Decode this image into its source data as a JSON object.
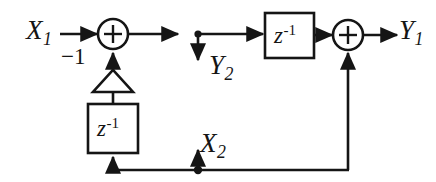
{
  "diagram": {
    "kind": "signal-flow-block-diagram",
    "title": "",
    "stroke_color": "#151515",
    "background_color": "#ffffff",
    "inputs": [
      {
        "id": "x1",
        "label": "X",
        "subscript": "1",
        "x": 38,
        "y": 31
      },
      {
        "id": "x2",
        "label": "X",
        "subscript": "2",
        "x": 212,
        "y": 146
      }
    ],
    "outputs": [
      {
        "id": "y1",
        "label": "Y",
        "subscript": "1",
        "x": 411,
        "y": 31
      },
      {
        "id": "y2",
        "label": "Y",
        "subscript": "2",
        "x": 221,
        "y": 68
      }
    ],
    "blocks": [
      {
        "id": "delay-top",
        "label": "z",
        "exponent": "-1",
        "shape": "rect",
        "x": 265,
        "y": 13,
        "w": 49,
        "h": 45
      },
      {
        "id": "delay-bottom",
        "label": "z",
        "exponent": "-1",
        "shape": "rect",
        "x": 88,
        "y": 104,
        "w": 50,
        "h": 49
      }
    ],
    "gain": {
      "id": "gain-minus-one",
      "label": "−1",
      "shape": "triangle-up",
      "label_x": 61,
      "label_y": 56
    },
    "adders": [
      {
        "id": "adder-left",
        "symbol": "+",
        "cx": 113,
        "cy": 34,
        "r": 15
      },
      {
        "id": "adder-right",
        "symbol": "+",
        "cx": 348,
        "cy": 35,
        "r": 15
      }
    ],
    "nodes": [
      {
        "id": "node-y2-tap",
        "cx": 198,
        "cy": 34
      },
      {
        "id": "node-x2-tap",
        "cx": 198,
        "cy": 170
      }
    ]
  }
}
